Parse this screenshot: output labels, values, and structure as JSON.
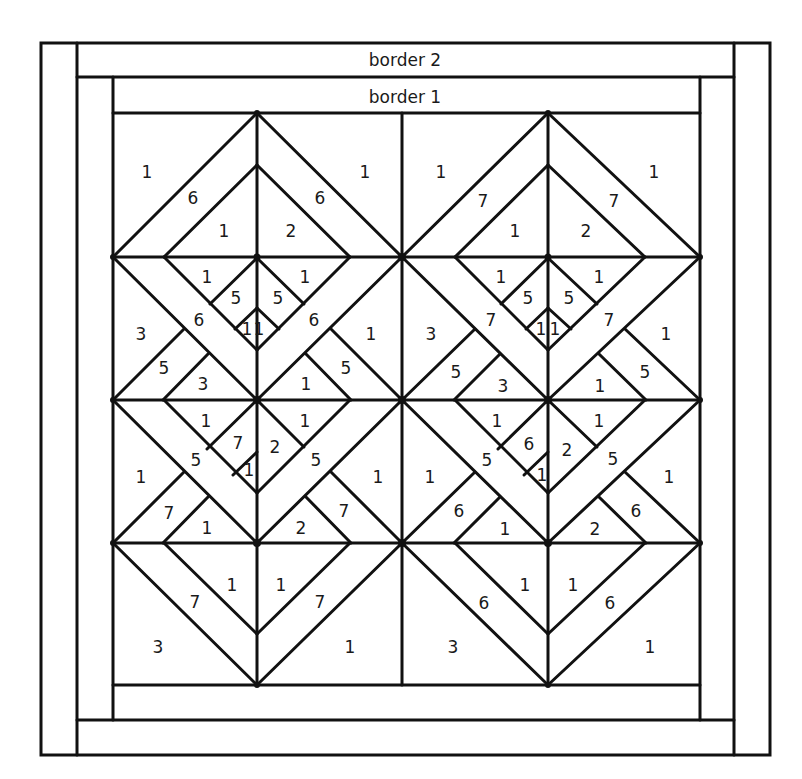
{
  "diagram": {
    "stroke_color": "#111111",
    "background": "#ffffff",
    "borders": [
      {
        "id": "border-2",
        "label": "border 2",
        "x": 405,
        "y": 60
      },
      {
        "id": "border-1",
        "label": "border 1",
        "x": 405,
        "y": 96
      }
    ],
    "blocks": [
      {
        "id": "left-block",
        "labels": [
          {
            "t": "1",
            "x": 147,
            "y": 172
          },
          {
            "t": "6",
            "x": 193,
            "y": 198
          },
          {
            "t": "1",
            "x": 224,
            "y": 231
          },
          {
            "t": "2",
            "x": 291,
            "y": 231
          },
          {
            "t": "6",
            "x": 320,
            "y": 198
          },
          {
            "t": "1",
            "x": 365,
            "y": 172
          },
          {
            "t": "1",
            "x": 207,
            "y": 277
          },
          {
            "t": "5",
            "x": 236,
            "y": 298
          },
          {
            "t": "5",
            "x": 278,
            "y": 298
          },
          {
            "t": "1",
            "x": 305,
            "y": 277
          },
          {
            "t": "6",
            "x": 199,
            "y": 320
          },
          {
            "t": "6",
            "x": 314,
            "y": 320
          },
          {
            "t": "1",
            "x": 247,
            "y": 329
          },
          {
            "t": "1",
            "x": 259,
            "y": 329
          },
          {
            "t": "3",
            "x": 141,
            "y": 334
          },
          {
            "t": "1",
            "x": 371,
            "y": 334
          },
          {
            "t": "5",
            "x": 164,
            "y": 368
          },
          {
            "t": "3",
            "x": 203,
            "y": 384
          },
          {
            "t": "1",
            "x": 306,
            "y": 384
          },
          {
            "t": "5",
            "x": 346,
            "y": 368
          },
          {
            "t": "1",
            "x": 206,
            "y": 421
          },
          {
            "t": "1",
            "x": 305,
            "y": 421
          },
          {
            "t": "7",
            "x": 238,
            "y": 443
          },
          {
            "t": "2",
            "x": 275,
            "y": 447
          },
          {
            "t": "5",
            "x": 196,
            "y": 460
          },
          {
            "t": "1",
            "x": 249,
            "y": 470
          },
          {
            "t": "5",
            "x": 316,
            "y": 460
          },
          {
            "t": "1",
            "x": 141,
            "y": 477
          },
          {
            "t": "1",
            "x": 378,
            "y": 477
          },
          {
            "t": "7",
            "x": 169,
            "y": 513
          },
          {
            "t": "1",
            "x": 207,
            "y": 528
          },
          {
            "t": "2",
            "x": 301,
            "y": 528
          },
          {
            "t": "7",
            "x": 344,
            "y": 511
          },
          {
            "t": "1",
            "x": 232,
            "y": 585
          },
          {
            "t": "1",
            "x": 281,
            "y": 585
          },
          {
            "t": "7",
            "x": 195,
            "y": 602
          },
          {
            "t": "7",
            "x": 320,
            "y": 602
          },
          {
            "t": "3",
            "x": 158,
            "y": 647
          },
          {
            "t": "1",
            "x": 350,
            "y": 647
          }
        ]
      },
      {
        "id": "right-block",
        "labels": [
          {
            "t": "1",
            "x": 441,
            "y": 172
          },
          {
            "t": "7",
            "x": 483,
            "y": 201
          },
          {
            "t": "1",
            "x": 515,
            "y": 231
          },
          {
            "t": "2",
            "x": 586,
            "y": 231
          },
          {
            "t": "7",
            "x": 614,
            "y": 201
          },
          {
            "t": "1",
            "x": 654,
            "y": 172
          },
          {
            "t": "1",
            "x": 501,
            "y": 277
          },
          {
            "t": "5",
            "x": 528,
            "y": 298
          },
          {
            "t": "5",
            "x": 569,
            "y": 298
          },
          {
            "t": "1",
            "x": 599,
            "y": 277
          },
          {
            "t": "7",
            "x": 491,
            "y": 320
          },
          {
            "t": "7",
            "x": 609,
            "y": 320
          },
          {
            "t": "1",
            "x": 541,
            "y": 329
          },
          {
            "t": "1",
            "x": 555,
            "y": 329
          },
          {
            "t": "3",
            "x": 431,
            "y": 334
          },
          {
            "t": "1",
            "x": 666,
            "y": 334
          },
          {
            "t": "5",
            "x": 456,
            "y": 372
          },
          {
            "t": "3",
            "x": 503,
            "y": 386
          },
          {
            "t": "1",
            "x": 600,
            "y": 386
          },
          {
            "t": "5",
            "x": 645,
            "y": 372
          },
          {
            "t": "1",
            "x": 497,
            "y": 421
          },
          {
            "t": "1",
            "x": 599,
            "y": 421
          },
          {
            "t": "6",
            "x": 529,
            "y": 444
          },
          {
            "t": "2",
            "x": 567,
            "y": 450
          },
          {
            "t": "5",
            "x": 487,
            "y": 460
          },
          {
            "t": "1",
            "x": 542,
            "y": 475
          },
          {
            "t": "5",
            "x": 613,
            "y": 459
          },
          {
            "t": "1",
            "x": 430,
            "y": 477
          },
          {
            "t": "1",
            "x": 669,
            "y": 477
          },
          {
            "t": "6",
            "x": 459,
            "y": 511
          },
          {
            "t": "1",
            "x": 505,
            "y": 529
          },
          {
            "t": "2",
            "x": 595,
            "y": 529
          },
          {
            "t": "6",
            "x": 636,
            "y": 511
          },
          {
            "t": "1",
            "x": 525,
            "y": 585
          },
          {
            "t": "1",
            "x": 573,
            "y": 585
          },
          {
            "t": "6",
            "x": 484,
            "y": 603
          },
          {
            "t": "6",
            "x": 610,
            "y": 603
          },
          {
            "t": "3",
            "x": 453,
            "y": 647
          },
          {
            "t": "1",
            "x": 650,
            "y": 647
          }
        ]
      }
    ]
  }
}
